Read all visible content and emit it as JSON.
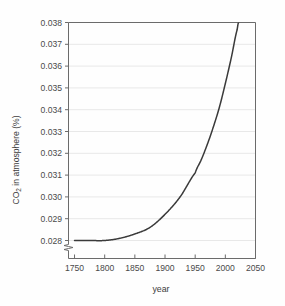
{
  "chart_data": {
    "type": "line",
    "title": "",
    "xlabel": "year",
    "ylabel": "CO2 in atmosphere (%)",
    "ylabel_main": "CO",
    "ylabel_sub": "2",
    "ylabel_rest": " in atmosphere (%)",
    "xlim": [
      1740,
      2050
    ],
    "ylim": [
      0.028,
      0.038
    ],
    "grid": true,
    "axis_break": true,
    "axis_break_axis": "y",
    "legend": "none",
    "line_color": "#3a3a3a",
    "grid_color": "#e8e8e8",
    "axis_color": "#6b6b6b",
    "text_color": "#4a4a4a",
    "background_color": "#fefefe",
    "xticks": [
      1750,
      1800,
      1850,
      1900,
      1950,
      2000,
      2050
    ],
    "xtick_labels": [
      "1750",
      "1800",
      "1850",
      "1900",
      "1950",
      "2000",
      "2050"
    ],
    "yticks": [
      0.028,
      0.029,
      0.03,
      0.031,
      0.032,
      0.033,
      0.034,
      0.035,
      0.036,
      0.037,
      0.038
    ],
    "ytick_labels": [
      "0.028",
      "0.029",
      "0.030",
      "0.031",
      "0.032",
      "0.033",
      "0.034",
      "0.035",
      "0.036",
      "0.037",
      "0.038"
    ],
    "x": [
      1750,
      1775,
      1800,
      1825,
      1850,
      1875,
      1900,
      1925,
      1950,
      1960,
      1970,
      1980,
      1990,
      2000,
      2010,
      2020,
      2022
    ],
    "values": [
      0.028,
      0.028,
      0.028,
      0.0281,
      0.0283,
      0.0286,
      0.0292,
      0.03,
      0.0311,
      0.0317,
      0.0324,
      0.0332,
      0.0341,
      0.0352,
      0.0364,
      0.0377,
      0.038
    ],
    "series": [
      {
        "name": "CO2 concentration",
        "values": [
          0.028,
          0.028,
          0.028,
          0.0281,
          0.0283,
          0.0286,
          0.0292,
          0.03,
          0.0311,
          0.0317,
          0.0324,
          0.0332,
          0.0341,
          0.0352,
          0.0364,
          0.0377,
          0.038
        ]
      }
    ]
  }
}
